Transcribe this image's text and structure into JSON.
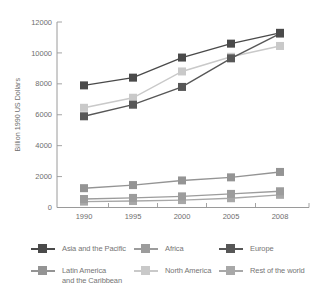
{
  "figure": {
    "background": "#ffffff",
    "axis_color": "#9a9a9a",
    "text_color": "#6e6e6e"
  },
  "chart_data": {
    "type": "line",
    "title": "",
    "xlabel": "",
    "ylabel": "Billion 1990 US Dollars",
    "categories": [
      "1990",
      "1995",
      "2000",
      "2005",
      "2008"
    ],
    "series": [
      {
        "name": "Asia and the Pacific",
        "color": "#4a4a4a",
        "values": [
          7900,
          8400,
          9700,
          10600,
          11300
        ]
      },
      {
        "name": "Africa",
        "color": "#9c9c9c",
        "values": [
          550,
          620,
          720,
          880,
          1050
        ]
      },
      {
        "name": "Europe",
        "color": "#575757",
        "values": [
          5900,
          6650,
          7800,
          9650,
          11250
        ]
      },
      {
        "name": "Latin America and the Caribbean",
        "color": "#949494",
        "values": [
          1250,
          1450,
          1750,
          1950,
          2300
        ]
      },
      {
        "name": "North America",
        "color": "#c9c9c9",
        "values": [
          6450,
          7100,
          8800,
          9750,
          10450
        ]
      },
      {
        "name": "Rest of the world",
        "color": "#a8a8a8",
        "values": [
          380,
          420,
          480,
          600,
          820
        ]
      }
    ],
    "ylim": [
      0,
      12000
    ],
    "yticks": [
      0,
      2000,
      4000,
      6000,
      8000,
      10000,
      12000
    ],
    "grid": false,
    "marker": "square",
    "legend_position": "bottom"
  },
  "legend": {
    "items": [
      {
        "label": "Asia and the Pacific",
        "series": "Asia and the Pacific",
        "color": "#4a4a4a"
      },
      {
        "label": "Africa",
        "series": "Africa",
        "color": "#9c9c9c"
      },
      {
        "label": "Europe",
        "series": "Europe",
        "color": "#575757"
      },
      {
        "label": "Latin America\nand the Caribbean",
        "series": "Latin America and the Caribbean",
        "color": "#949494"
      },
      {
        "label": "North America",
        "series": "North America",
        "color": "#c9c9c9"
      },
      {
        "label": "Rest of the world",
        "series": "Rest of the world",
        "color": "#a8a8a8"
      }
    ]
  }
}
